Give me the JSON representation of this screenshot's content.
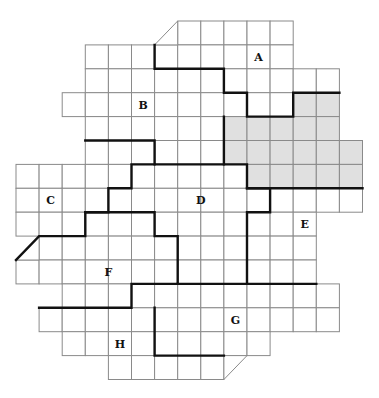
{
  "diagram": {
    "title": "",
    "grid": {
      "origin_x": 16,
      "origin_y": 21,
      "cell_w": 23.1,
      "cell_h": 23.9,
      "rows": [
        {
          "row": 0,
          "from": 7,
          "to": 11
        },
        {
          "row": 1,
          "from": 3,
          "to": 11
        },
        {
          "row": 2,
          "from": 3,
          "to": 13
        },
        {
          "row": 3,
          "from": 2,
          "to": 13
        },
        {
          "row": 4,
          "from": 3,
          "to": 13
        },
        {
          "row": 5,
          "from": 3,
          "to": 14
        },
        {
          "row": 6,
          "from": 0,
          "to": 14
        },
        {
          "row": 7,
          "from": 0,
          "to": 14
        },
        {
          "row": 8,
          "from": 0,
          "to": 12
        },
        {
          "row": 9,
          "from": 1,
          "to": 12
        },
        {
          "row": 10,
          "from": 0,
          "to": 12
        },
        {
          "row": 11,
          "from": 2,
          "to": 13
        },
        {
          "row": 12,
          "from": 1,
          "to": 13
        },
        {
          "row": 13,
          "from": 2,
          "to": 10
        },
        {
          "row": 14,
          "from": 4,
          "to": 8
        }
      ],
      "half_cells": [
        {
          "col": 6,
          "row": 0,
          "corner": "lower-right"
        },
        {
          "col": 0,
          "row": 9,
          "corner": "lower-right"
        },
        {
          "col": 9,
          "row": 14,
          "corner": "upper-left"
        }
      ],
      "shaded_cells": [
        [
          12,
          3
        ],
        [
          13,
          3
        ],
        [
          9,
          4
        ],
        [
          10,
          4
        ],
        [
          11,
          4
        ],
        [
          12,
          4
        ],
        [
          13,
          4
        ],
        [
          9,
          5
        ],
        [
          10,
          5
        ],
        [
          11,
          5
        ],
        [
          12,
          5
        ],
        [
          13,
          5
        ],
        [
          14,
          5
        ],
        [
          10,
          6
        ],
        [
          11,
          6
        ],
        [
          12,
          6
        ],
        [
          13,
          6
        ],
        [
          14,
          6
        ]
      ],
      "shade_color": "#e0e0e0",
      "grid_line_color": "#8a8a8a",
      "boundary_color": "#111111"
    },
    "boundaries": [
      {
        "name": "a-b-boundary",
        "points": [
          [
            6,
            1
          ],
          [
            6,
            2
          ],
          [
            9,
            2
          ],
          [
            9,
            3
          ],
          [
            10,
            3
          ],
          [
            10,
            4
          ],
          [
            12,
            4
          ],
          [
            12,
            3
          ],
          [
            14,
            3
          ]
        ]
      },
      {
        "name": "shaded-left-boundary",
        "points": [
          [
            9,
            4
          ],
          [
            9,
            6
          ],
          [
            10,
            6
          ],
          [
            10,
            7
          ],
          [
            15,
            7
          ]
        ]
      },
      {
        "name": "b-d-boundary",
        "points": [
          [
            3,
            5
          ],
          [
            6,
            5
          ],
          [
            6,
            6
          ],
          [
            9,
            6
          ]
        ]
      },
      {
        "name": "c-d-boundary",
        "points": [
          [
            6,
            6
          ],
          [
            5,
            6
          ],
          [
            5,
            7
          ],
          [
            4,
            7
          ],
          [
            4,
            8
          ],
          [
            3,
            8
          ],
          [
            3,
            9
          ],
          [
            1,
            9
          ],
          [
            0,
            10
          ]
        ]
      },
      {
        "name": "d-f-boundary",
        "points": [
          [
            3,
            8
          ],
          [
            6,
            8
          ],
          [
            6,
            9
          ],
          [
            7,
            9
          ],
          [
            7,
            11
          ],
          [
            5,
            11
          ],
          [
            5,
            12
          ],
          [
            1,
            12
          ]
        ]
      },
      {
        "name": "d-e-boundary",
        "points": [
          [
            10,
            7
          ],
          [
            11,
            7
          ],
          [
            11,
            8
          ],
          [
            10,
            8
          ],
          [
            10,
            11
          ],
          [
            13,
            11
          ]
        ]
      },
      {
        "name": "f-g-boundary",
        "points": [
          [
            7,
            11
          ],
          [
            10,
            11
          ]
        ]
      },
      {
        "name": "g-h-boundary",
        "points": [
          [
            6,
            12
          ],
          [
            6,
            14
          ],
          [
            9,
            14
          ]
        ]
      }
    ],
    "labels": [
      {
        "text": "A",
        "col": 10,
        "row": 1
      },
      {
        "text": "B",
        "col": 5,
        "row": 3
      },
      {
        "text": "C",
        "col": 1,
        "row": 7
      },
      {
        "text": "D",
        "col": 7.5,
        "row": 7
      },
      {
        "text": "E",
        "col": 12,
        "row": 8
      },
      {
        "text": "F",
        "col": 3.5,
        "row": 10
      },
      {
        "text": "G",
        "col": 9,
        "row": 12
      },
      {
        "text": "H",
        "col": 4,
        "row": 13
      }
    ]
  }
}
